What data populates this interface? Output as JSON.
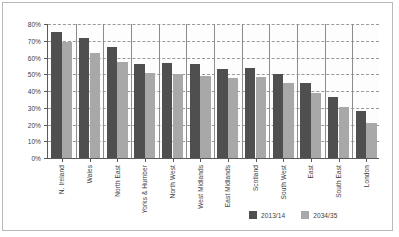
{
  "chart_data": {
    "type": "bar",
    "title": "",
    "subtitle": "",
    "xlabel": "",
    "ylabel": "",
    "ylim": [
      0,
      80
    ],
    "ytick_labels": [
      "0%",
      "10%",
      "20%",
      "30%",
      "40%",
      "50%",
      "60%",
      "70%",
      "80%"
    ],
    "ytick_values": [
      0,
      10,
      20,
      30,
      40,
      50,
      60,
      70,
      80
    ],
    "grid": true,
    "legend_position": "bottom-right",
    "categories": [
      "N. Ireland",
      "Wales",
      "North East",
      "Yorks & Humber",
      "North West",
      "West Midlands",
      "East Midlands",
      "Scotland",
      "South West",
      "East",
      "South East",
      "London"
    ],
    "series": [
      {
        "name": "2013/14",
        "color": "#4f4f4f",
        "values": [
          74.5,
          71.0,
          66.0,
          56.0,
          56.5,
          55.5,
          52.5,
          53.5,
          50.0,
          44.5,
          36.0,
          28.0
        ]
      },
      {
        "name": "2034/35",
        "color": "#a8a8a8",
        "values": [
          69.0,
          62.0,
          57.0,
          50.5,
          49.5,
          48.5,
          47.5,
          48.0,
          44.5,
          38.5,
          30.0,
          21.0
        ]
      }
    ]
  },
  "legend": {
    "items": [
      {
        "label": "2013/14",
        "color": "#4f4f4f"
      },
      {
        "label": "2034/35",
        "color": "#a8a8a8"
      }
    ]
  },
  "colors": {
    "series_1": "#4f4f4f",
    "series_2": "#a8a8a8",
    "axis": "#595959",
    "grid": "#9a9a9a",
    "background": "#ffffff",
    "frame": "#b9b9b9"
  }
}
